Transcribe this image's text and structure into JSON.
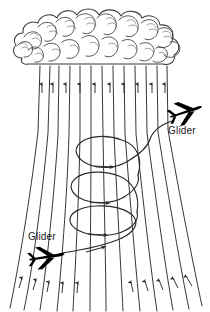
{
  "figure": {
    "background_color": "#ffffff",
    "line_color": "#2b2b2b",
    "cloud_color": "#3a3a3a",
    "silhouette_color": "#000000",
    "width": 210,
    "height": 312
  },
  "cloud": {
    "name": "cumulus-cloud",
    "description": "Hand-drawn cumulus cloud base spanning the top of the figure"
  },
  "updraft": {
    "name": "updraft-flow-lines",
    "arrow_count": 10,
    "line_count": 13,
    "direction": "upward",
    "description": "Converging airflow streamlines rising into the cloud base"
  },
  "helix": {
    "name": "thermal-helix",
    "turns": 3,
    "rotation": "clockwise-viewed-from-above",
    "arrow_count": 4,
    "description": "Spiral climb path flown inside the thermal"
  },
  "gliders": [
    {
      "id": "glider-upper",
      "label": "Glider",
      "position": "upper-right",
      "heading": "right",
      "label_x": 168,
      "label_y": 134
    },
    {
      "id": "glider-lower",
      "label": "Glider",
      "position": "lower-left",
      "heading": "right",
      "label_x": 28,
      "label_y": 240
    }
  ]
}
